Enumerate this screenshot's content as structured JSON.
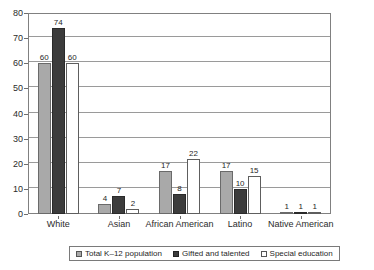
{
  "chart_data": {
    "type": "bar",
    "title": "",
    "subtitle": "",
    "xlabel": "",
    "ylabel": "",
    "categories": [
      "White",
      "Asian",
      "African American",
      "Latino",
      "Native American"
    ],
    "series": [
      {
        "name": "Total K–12 population",
        "values": [
          60,
          4,
          17,
          17,
          1
        ],
        "color": "#a9a9a9"
      },
      {
        "name": "Gifted and talented",
        "values": [
          74,
          7,
          8,
          10,
          1
        ],
        "color": "#3c3c3c"
      },
      {
        "name": "Special education",
        "values": [
          60,
          2,
          22,
          15,
          1
        ],
        "color": "#ffffff"
      }
    ],
    "ylim": [
      0,
      80
    ],
    "yticks": [
      0,
      10,
      20,
      30,
      40,
      50,
      60,
      70,
      80
    ],
    "ytick_labels": [
      "0",
      "10",
      "20",
      "30",
      "40",
      "50",
      "60",
      "70",
      "80"
    ],
    "grid": true,
    "grid_axis": "y",
    "legend_position": "bottom",
    "data_labels": true,
    "bar_label_format": "integer"
  },
  "legend": {
    "items": [
      {
        "label": "Total K–12 population",
        "swatch": "light-gray"
      },
      {
        "label": "Gifted and talented",
        "swatch": "dark-gray"
      },
      {
        "label": "Special education",
        "swatch": "white"
      }
    ]
  }
}
